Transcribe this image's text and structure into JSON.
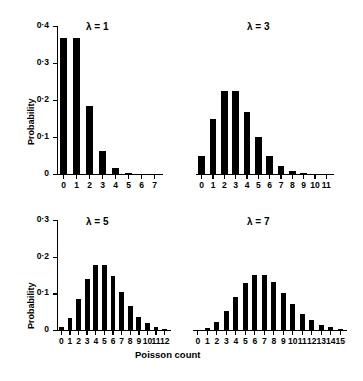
{
  "figure": {
    "xlabel": "Poisson count",
    "ylabel": "Probability",
    "background": "#ffffff",
    "bar_color": "#000000"
  },
  "chart_data": [
    {
      "type": "bar",
      "title": "λ = 1",
      "lambda": 1,
      "xlabel": "",
      "ylabel": "Probability",
      "categories": [
        "0",
        "1",
        "2",
        "3",
        "4",
        "5",
        "6",
        "7"
      ],
      "values": [
        0.368,
        0.368,
        0.184,
        0.061,
        0.015,
        0.003,
        0.001,
        0.0
      ],
      "ylim": [
        0,
        0.4
      ],
      "yticks": [
        0,
        0.1,
        0.2,
        0.3,
        0.4
      ],
      "ytick_labels": [
        "0",
        "0·1",
        "0·2",
        "0·3",
        "0·4"
      ],
      "grid": false,
      "legend": false,
      "yaxis_visible": true
    },
    {
      "type": "bar",
      "title": "λ = 3",
      "lambda": 3,
      "xlabel": "",
      "ylabel": "",
      "categories": [
        "0",
        "1",
        "2",
        "3",
        "4",
        "5",
        "6",
        "7",
        "8",
        "9",
        "10",
        "11"
      ],
      "values": [
        0.05,
        0.149,
        0.224,
        0.224,
        0.168,
        0.101,
        0.05,
        0.022,
        0.008,
        0.003,
        0.001,
        0.0
      ],
      "ylim": [
        0,
        0.4
      ],
      "yticks": [],
      "ytick_labels": [],
      "grid": false,
      "legend": false,
      "yaxis_visible": false
    },
    {
      "type": "bar",
      "title": "λ = 5",
      "lambda": 5,
      "xlabel": "",
      "ylabel": "Probability",
      "categories": [
        "0",
        "1",
        "2",
        "3",
        "4",
        "5",
        "6",
        "7",
        "8",
        "9",
        "10",
        "11",
        "12"
      ],
      "values": [
        0.007,
        0.034,
        0.084,
        0.14,
        0.176,
        0.176,
        0.146,
        0.104,
        0.065,
        0.036,
        0.018,
        0.008,
        0.003
      ],
      "ylim": [
        0,
        0.3
      ],
      "yticks": [
        0,
        0.1,
        0.2,
        0.3
      ],
      "ytick_labels": [
        "0",
        "0·1",
        "0·2",
        "0·3"
      ],
      "grid": false,
      "legend": false,
      "yaxis_visible": true
    },
    {
      "type": "bar",
      "title": "λ = 7",
      "lambda": 7,
      "xlabel": "Poisson count",
      "ylabel": "",
      "categories": [
        "0",
        "1",
        "2",
        "3",
        "4",
        "5",
        "6",
        "7",
        "8",
        "9",
        "10",
        "11",
        "12",
        "13",
        "14",
        "15"
      ],
      "values": [
        0.001,
        0.006,
        0.022,
        0.052,
        0.091,
        0.128,
        0.149,
        0.149,
        0.13,
        0.101,
        0.071,
        0.045,
        0.026,
        0.014,
        0.007,
        0.003
      ],
      "ylim": [
        0,
        0.3
      ],
      "yticks": [],
      "ytick_labels": [],
      "grid": false,
      "legend": false,
      "yaxis_visible": false
    }
  ]
}
